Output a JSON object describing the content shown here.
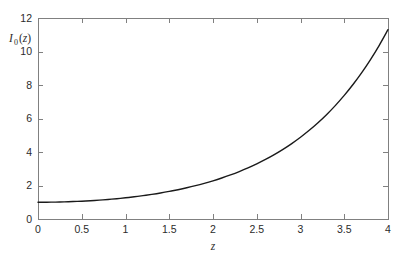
{
  "chart_data": {
    "type": "line",
    "title": "",
    "xlabel": "z",
    "ylabel": "I0(z)",
    "ylabel_parts": {
      "symbol": "I",
      "subscript": "0",
      "argument": "(z)"
    },
    "xlim": [
      0,
      4
    ],
    "ylim": [
      0,
      12
    ],
    "xticks": [
      0,
      0.5,
      1,
      1.5,
      2,
      2.5,
      3,
      3.5,
      4
    ],
    "xtick_labels": [
      "0",
      "0.5",
      "1",
      "1.5",
      "2",
      "2.5",
      "3",
      "3.5",
      "4"
    ],
    "yticks": [
      0,
      2,
      4,
      6,
      8,
      10,
      12
    ],
    "ytick_labels": [
      "0",
      "2",
      "4",
      "6",
      "8",
      "10",
      "12"
    ],
    "grid": false,
    "legend": null,
    "box": true,
    "tick_direction": "in",
    "series": [
      {
        "name": "I0(z)",
        "color": "#1a1a1a",
        "linewidth": 1.4,
        "x": [
          0,
          0.1,
          0.2,
          0.3,
          0.4,
          0.5,
          0.6,
          0.7,
          0.8,
          0.9,
          1,
          1.1,
          1.2,
          1.3,
          1.4,
          1.5,
          1.6,
          1.7,
          1.8,
          1.9,
          2,
          2.1,
          2.2,
          2.3,
          2.4,
          2.5,
          2.6,
          2.7,
          2.8,
          2.9,
          3,
          3.1,
          3.2,
          3.3,
          3.4,
          3.5,
          3.6,
          3.7,
          3.8,
          3.9,
          4
        ],
        "values": [
          1.0,
          1.0025,
          1.01,
          1.0226,
          1.0404,
          1.0635,
          1.092,
          1.1263,
          1.1665,
          1.213,
          1.2661,
          1.3262,
          1.3937,
          1.4693,
          1.5534,
          1.6467,
          1.75,
          1.864,
          1.9896,
          2.1277,
          2.2796,
          2.4463,
          2.6291,
          2.8296,
          3.0493,
          3.2898,
          3.5533,
          3.8417,
          4.1573,
          4.5028,
          4.8808,
          5.2945,
          5.7472,
          6.2426,
          6.7848,
          7.3782,
          8.0277,
          8.7386,
          9.5169,
          10.369,
          11.3019
        ]
      }
    ]
  },
  "figure": {
    "background_color": "#ffffff",
    "axis_color": "#808080",
    "text_color": "#2b2b2b"
  }
}
